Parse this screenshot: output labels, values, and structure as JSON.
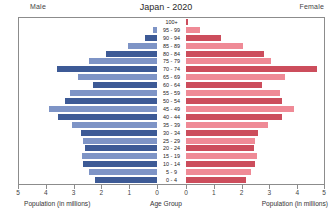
{
  "header": {
    "title": "Japan - 2020",
    "male_label": "Male",
    "female_label": "Female"
  },
  "captions": {
    "left": "Population (in millions)",
    "center": "Age Group",
    "right": "Population (in millions)"
  },
  "colors": {
    "male_dark": "#3d5a96",
    "male_light": "#7e94c6",
    "female_dark": "#cc4d5c",
    "female_light": "#ef8a96",
    "frame": "#8c8c8c"
  },
  "chart_data": {
    "type": "bar",
    "subtype": "population-pyramid",
    "title": "Japan - 2020",
    "xlabel": "Population (in millions)",
    "ylabel": "Age Group",
    "xlim_left": [
      5,
      0
    ],
    "xlim_right": [
      0,
      5
    ],
    "grid": false,
    "left_ticks": [
      "5",
      "4",
      "3",
      "2",
      "1",
      "0"
    ],
    "right_ticks": [
      "0",
      "1",
      "2",
      "3",
      "4",
      "5"
    ],
    "categories": [
      "100+",
      "95 - 99",
      "90 - 94",
      "85 - 89",
      "80 - 84",
      "75 - 79",
      "70 - 74",
      "65 - 69",
      "60 - 64",
      "55 - 59",
      "50 - 54",
      "45 - 49",
      "40 - 44",
      "35 - 39",
      "30 - 34",
      "25 - 29",
      "20 - 24",
      "15 - 19",
      "10 - 14",
      "5 - 9",
      "0 - 4"
    ],
    "series": [
      {
        "name": "Male",
        "side": "left",
        "values": [
          0.02,
          0.15,
          0.45,
          1.05,
          1.85,
          2.45,
          3.6,
          2.85,
          2.3,
          3.15,
          3.3,
          3.9,
          3.55,
          3.05,
          2.75,
          2.65,
          2.6,
          2.7,
          2.65,
          2.45,
          2.25
        ]
      },
      {
        "name": "Female",
        "side": "right",
        "values": [
          0.07,
          0.5,
          1.25,
          2.05,
          2.8,
          3.05,
          4.7,
          3.55,
          2.75,
          3.4,
          3.45,
          3.9,
          3.45,
          2.95,
          2.6,
          2.5,
          2.45,
          2.55,
          2.5,
          2.35,
          2.15
        ]
      }
    ]
  }
}
